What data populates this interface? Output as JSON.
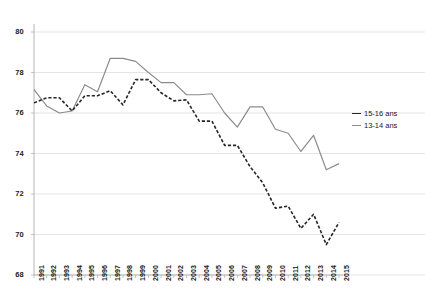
{
  "chart_data": {
    "type": "line",
    "title": "",
    "subtitle": "",
    "xlabel": "",
    "ylabel": "",
    "x": [
      1991,
      1992,
      1993,
      1994,
      1995,
      1996,
      1997,
      1998,
      1999,
      2000,
      2001,
      2002,
      2003,
      2004,
      2005,
      2006,
      2007,
      2008,
      2009,
      2010,
      2011,
      2012,
      2013,
      2014,
      2015
    ],
    "xtick_labels": [
      "1991",
      "1992",
      "1993",
      "1994",
      "1995",
      "1996",
      "1997",
      "1998",
      "1999",
      "2000",
      "2001",
      "2002",
      "2003",
      "2004",
      "2005",
      "2006",
      "2007",
      "2008",
      "2009",
      "2010",
      "2011",
      "2012",
      "2013",
      "2014",
      "2015"
    ],
    "ytick_labels": [
      "80",
      "78",
      "76",
      "74",
      "72",
      "70",
      "68"
    ],
    "yticks": [
      80,
      78,
      76,
      74,
      72,
      70,
      68
    ],
    "ylim": [
      68,
      80
    ],
    "xlim": [
      1991,
      2015
    ],
    "grid": "horizontal",
    "legend_position": "right",
    "series": [
      {
        "name": "15-16 ans",
        "style": "dashed",
        "color": "#262626",
        "values": [
          76.5,
          76.75,
          76.75,
          76.1,
          76.85,
          76.85,
          77.1,
          76.4,
          77.65,
          77.65,
          77.0,
          76.6,
          76.65,
          75.6,
          75.6,
          74.4,
          74.4,
          73.35,
          72.55,
          71.3,
          71.4,
          70.3,
          71.0,
          69.5,
          70.6
        ]
      },
      {
        "name": "13-14 ans",
        "style": "solid",
        "color": "#8c8c8c",
        "values": [
          77.15,
          76.35,
          76.0,
          76.1,
          77.4,
          77.05,
          78.7,
          78.7,
          78.55,
          78.0,
          77.5,
          77.5,
          76.9,
          76.9,
          76.95,
          76.0,
          75.3,
          76.3,
          76.3,
          75.2,
          75.0,
          74.1,
          74.9,
          73.2,
          73.5
        ]
      }
    ]
  },
  "legend": {
    "items": [
      {
        "label": "15-16 ans",
        "color": "#262626",
        "style": "dashed"
      },
      {
        "label": "13-14 ans",
        "color": "#8c8c8c",
        "style": "solid"
      }
    ]
  }
}
